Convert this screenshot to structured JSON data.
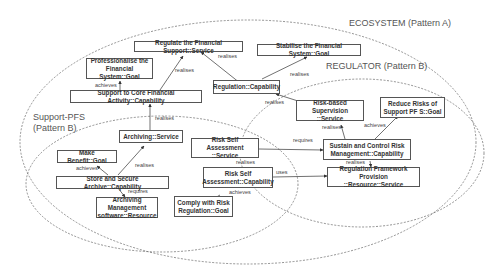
{
  "regions": {
    "ecosystem": "ECOSYSTEM (Pattern A)",
    "regulator": "REGULATOR (Pattern B)",
    "support_pfs": "Support-PFS\n(Pattern B)"
  },
  "nodes": {
    "regulate_service": "Regulate the Financial Support::Service",
    "stabilise_goal": "Stabilise the Financial System::Goal",
    "professionalise_goal": "Professionalise the\nFinancial System::Goal",
    "support_capability": "Support to Core Financial Activity::Capability",
    "regulation_capability": "Regulation::Capability",
    "risk_supervision_service": "Risk-based Supervision\n::Service",
    "reduce_risks_goal": "Reduce Risks of\nSupport PF S::Goal",
    "archiving_service": "Archiving::Service",
    "make_benefit_goal": "Make Benefit::Goal",
    "store_archive_capability": "Store and Secure Archive::Capability",
    "archiving_software_resource": "Archiving Management\nsoftware::Resource",
    "risk_self_service": "Risk Self Assessment\n::Service",
    "risk_self_capability": "Risk Self\nAssessment::Capability",
    "comply_goal": "Comply with Risk\nRegulation::Goal",
    "sustain_capability": "Sustain and Control Risk\nManagement::Capability",
    "regulation_framework_service": "Regulation Framework Provision\n::Resource::Service"
  },
  "edges": {
    "e1": "realises",
    "e2": "realises",
    "e3": "realises",
    "e4": "achieves",
    "e5": "realises",
    "e6": "realises",
    "e7": "realises",
    "e8": "achieves",
    "e9": "realises",
    "e10": "achieves",
    "e11": "requires",
    "e12": "requires",
    "e13": "realises",
    "e14": "achieves",
    "e15": "uses",
    "e16": "realises"
  }
}
